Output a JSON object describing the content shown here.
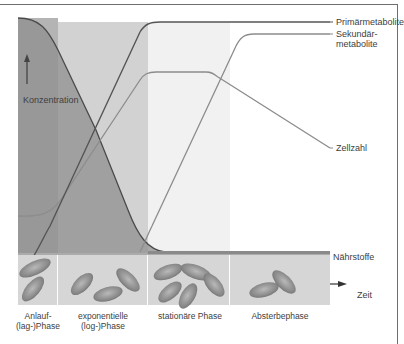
{
  "diagram": {
    "y_axis_label": "Konzentration",
    "x_axis_label": "Zeit",
    "curves": [
      {
        "id": "primaer",
        "label": "Primärmetabolite",
        "color": "#555555"
      },
      {
        "id": "sekundaer",
        "label_line1": "Sekundär-",
        "label_line2": "metabolite",
        "color": "#8c8c8c"
      },
      {
        "id": "zellzahl",
        "label": "Zellzahl",
        "color": "#8c8c8c"
      },
      {
        "id": "naehrstoffe",
        "label": "Nährstoffe",
        "color": "#4a4a4a"
      }
    ],
    "phases": [
      {
        "line1": "Anlauf-",
        "line2": "(lag-)Phase"
      },
      {
        "line1": "exponentielle",
        "line2": "(log-)Phase"
      },
      {
        "line1": "stationäre Phase",
        "line2": ""
      },
      {
        "line1": "Absterbephase",
        "line2": ""
      }
    ],
    "colors": {
      "lag_bg": "#b4b4b4",
      "exp_bg": "#d2d2d2",
      "stat_bg": "#f0f0f0",
      "death_bg": "#ffffff",
      "nutrient_fill": "#8f8f8f",
      "cell_panel": "#d6d6d6"
    }
  }
}
